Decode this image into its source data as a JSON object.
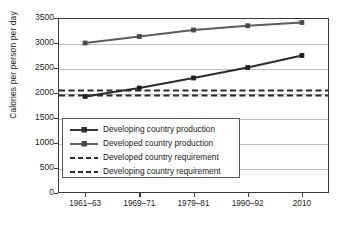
{
  "chart_data": {
    "type": "line",
    "title": "",
    "xlabel": "",
    "ylabel": "Calories per person per day",
    "categories": [
      "1961–63",
      "1969–71",
      "1979–81",
      "1990–92",
      "2010"
    ],
    "ylim": [
      0,
      3500
    ],
    "yticks": [
      0,
      500,
      1000,
      1500,
      2000,
      2500,
      3000,
      3500
    ],
    "ytick_labels": [
      "0",
      "500",
      "1000",
      "1500",
      "2000",
      "2500",
      "3000",
      "3500"
    ],
    "grid": true,
    "legend_position": "center-left",
    "series": [
      {
        "name": "Developing country production",
        "style": "solid",
        "marker": "square",
        "color": "#2b2b2b",
        "values": [
          1930,
          2100,
          2300,
          2510,
          2750
        ]
      },
      {
        "name": "Developed country production",
        "style": "solid",
        "marker": "square",
        "color": "#5c5c5c",
        "values": [
          3000,
          3130,
          3260,
          3345,
          3410
        ]
      },
      {
        "name": "Developed country requirement",
        "style": "dashed",
        "marker": "none",
        "color": "#2b2b2b",
        "constant": 2050
      },
      {
        "name": "Developing country requirement",
        "style": "dashed",
        "marker": "none",
        "color": "#2b2b2b",
        "constant": 1950
      }
    ]
  },
  "legend": {
    "items": [
      {
        "label": "Developing country production"
      },
      {
        "label": "Developed country production"
      },
      {
        "label": "Developed country requirement"
      },
      {
        "label": "Developing country requirement"
      }
    ]
  }
}
